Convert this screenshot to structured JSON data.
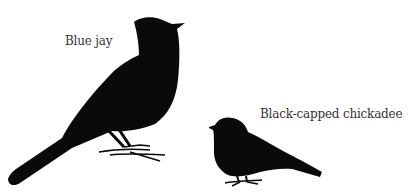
{
  "figure": {
    "silhouette_color": "#0a0a0a",
    "background": "#ffffff",
    "birds": [
      {
        "label": "Blue jay",
        "size": "large"
      },
      {
        "label": "Black-capped chickadee",
        "size": "small"
      }
    ]
  }
}
